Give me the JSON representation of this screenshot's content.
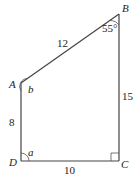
{
  "diagram": {
    "type": "quadrilateral",
    "vertices": [
      {
        "name": "A",
        "label": "A"
      },
      {
        "name": "B",
        "label": "B"
      },
      {
        "name": "C",
        "label": "C"
      },
      {
        "name": "D",
        "label": "D"
      }
    ],
    "sides": [
      {
        "between": "AB",
        "label": "12"
      },
      {
        "between": "BC",
        "label": "15"
      },
      {
        "between": "CD",
        "label": "10"
      },
      {
        "between": "DA",
        "label": "8"
      }
    ],
    "angles": [
      {
        "at": "B",
        "label": "55°"
      },
      {
        "at": "A",
        "label": "b"
      },
      {
        "at": "D",
        "label": "a"
      },
      {
        "at": "C",
        "label": "right angle"
      }
    ]
  }
}
